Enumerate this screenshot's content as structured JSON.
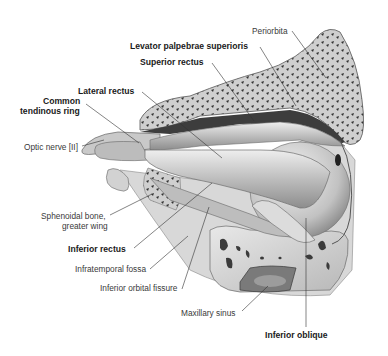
{
  "figure": {
    "labels": [
      {
        "id": "periorbita",
        "text": "Periorbita",
        "bold": false
      },
      {
        "id": "levator",
        "text": "Levator palpebrae superioris",
        "bold": true
      },
      {
        "id": "superior_rectus",
        "text": "Superior rectus",
        "bold": true
      },
      {
        "id": "lateral_rectus",
        "text": "Lateral rectus",
        "bold": true
      },
      {
        "id": "common_ring_1",
        "text": "Common",
        "bold": true
      },
      {
        "id": "common_ring_2",
        "text": "tendinous ring",
        "bold": true
      },
      {
        "id": "optic_nerve",
        "text": "Optic nerve [II]",
        "bold": false
      },
      {
        "id": "sphenoid_1",
        "text": "Sphenoidal bone,",
        "bold": false
      },
      {
        "id": "sphenoid_2",
        "text": "greater wing",
        "bold": false
      },
      {
        "id": "inferior_rectus",
        "text": "Inferior rectus",
        "bold": true
      },
      {
        "id": "infratemporal",
        "text": "Infratemporal fossa",
        "bold": false
      },
      {
        "id": "inf_orbital_fissure",
        "text": "Inferior orbital fissure",
        "bold": false
      },
      {
        "id": "maxillary_sinus",
        "text": "Maxillary sinus",
        "bold": false
      },
      {
        "id": "inferior_oblique",
        "text": "Inferior oblique",
        "bold": true
      }
    ]
  },
  "colors": {
    "background": "#ffffff",
    "bone": "#d6d6d6",
    "bone_dark": "#4a4a4a",
    "muscle": "#c8c8c8",
    "muscle_light": "#e6e6e6",
    "leader": "#333333"
  }
}
